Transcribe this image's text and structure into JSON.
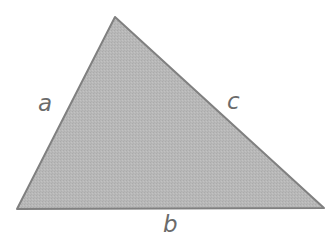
{
  "figure": {
    "name": "labeled-triangle",
    "background_color": "#ffffff",
    "canvas": {
      "width": 332,
      "height": 251
    }
  },
  "shape": {
    "type": "triangle",
    "fill_color": "#b6b6b6",
    "stroke_color": "#808080",
    "stroke_width": 2,
    "texture": "fine dither / halftone speckle",
    "vertices": [
      {
        "name": "apex",
        "x": 115,
        "y": 17
      },
      {
        "name": "bottom-right",
        "x": 324,
        "y": 208
      },
      {
        "name": "bottom-left",
        "x": 17,
        "y": 209
      }
    ],
    "points_attr": "115,17 324,208 17,209"
  },
  "labels": {
    "a": {
      "text": "a",
      "side": "left",
      "color": "#6b6b6b",
      "x": 45,
      "y": 104
    },
    "b": {
      "text": "b",
      "side": "bottom",
      "color": "#6b6b6b",
      "x": 171,
      "y": 225
    },
    "c": {
      "text": "c",
      "side": "right",
      "color": "#6b6b6b",
      "x": 234,
      "y": 102
    }
  }
}
